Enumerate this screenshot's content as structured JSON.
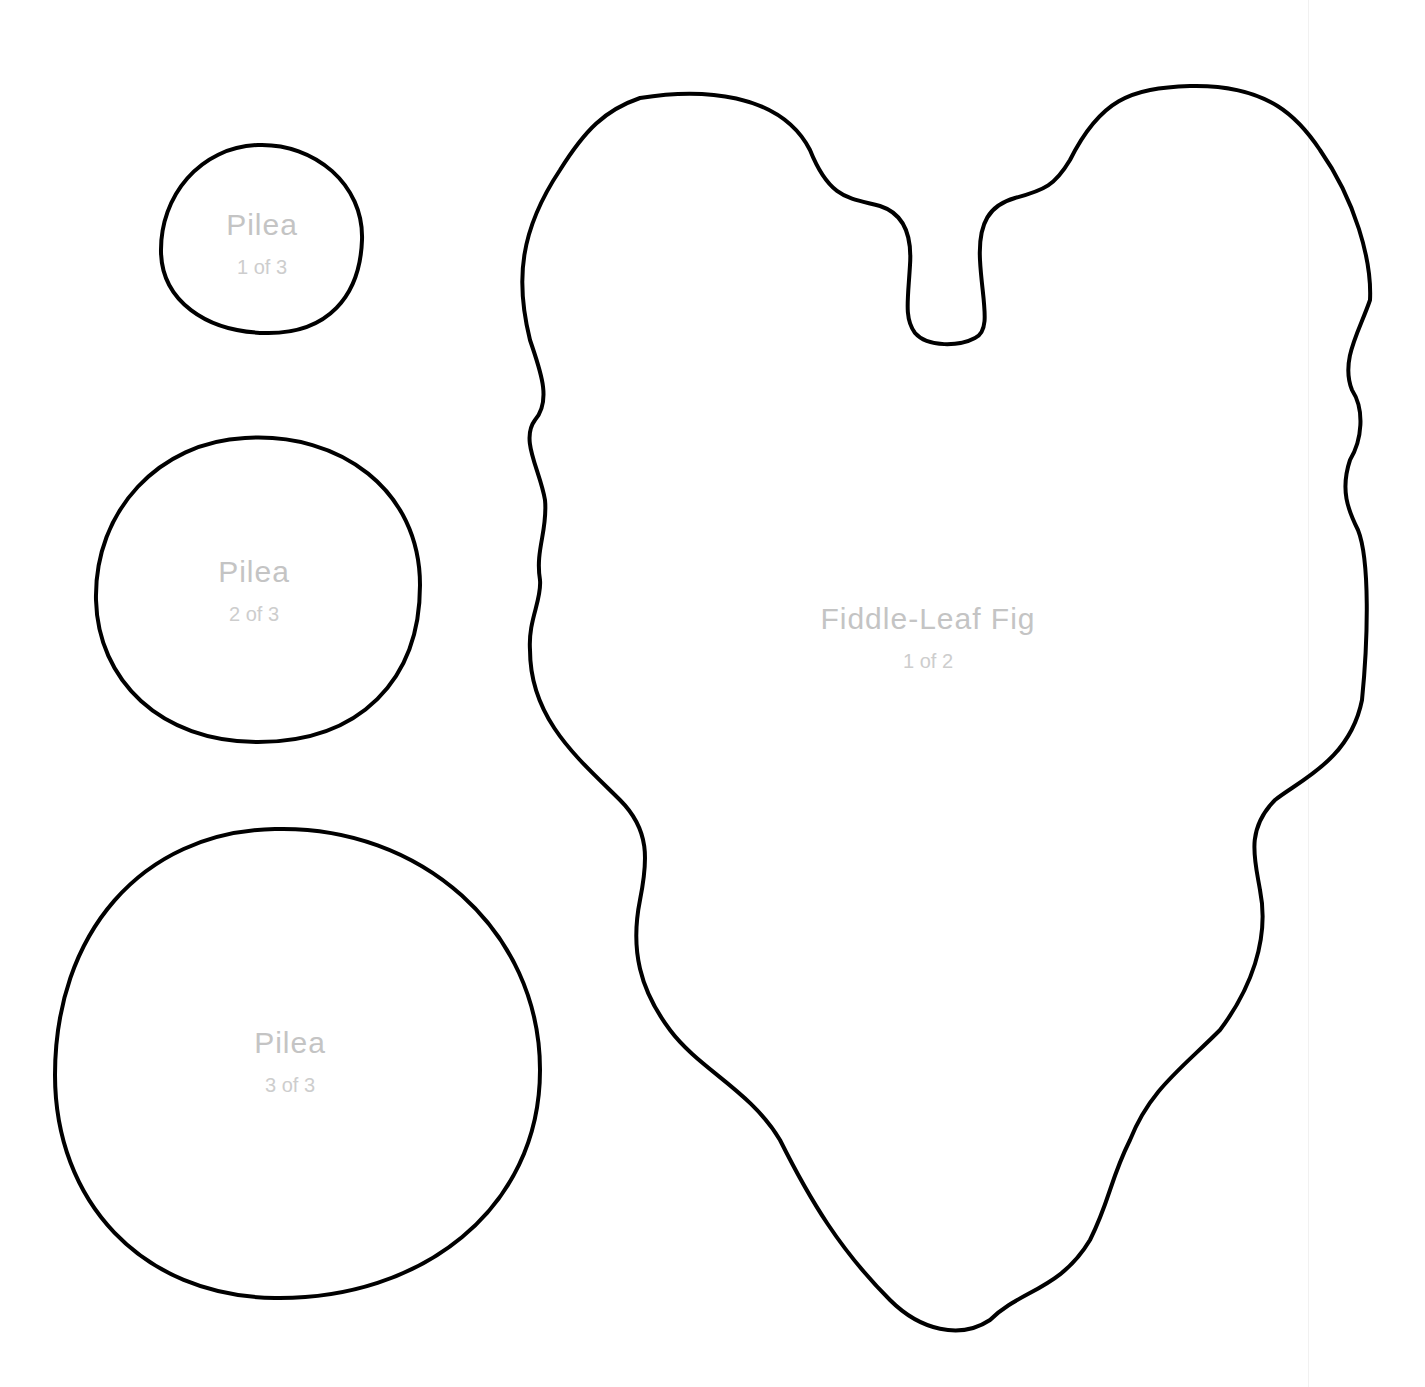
{
  "page": {
    "type": "printable plant leaf templates",
    "stroke_color": "#000000",
    "label_color": "#c4c4c4",
    "background": "#ffffff"
  },
  "shapes": [
    {
      "name": "Pilea",
      "count": "1 of 3"
    },
    {
      "name": "Pilea",
      "count": "2 of 3"
    },
    {
      "name": "Pilea",
      "count": "3 of 3"
    },
    {
      "name": "Fiddle-Leaf Fig",
      "count": "1 of 2"
    }
  ]
}
